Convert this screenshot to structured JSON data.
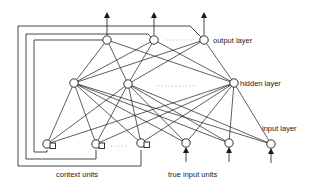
{
  "diagram": {
    "labels": {
      "output_layer": "output layer",
      "hidden_layer": "hidden layer",
      "input_layer": "input layer",
      "context_units": "context units",
      "true_input_units": "true input units"
    },
    "layers": {
      "output": [
        {
          "id": "o1",
          "x": 107,
          "y": 40
        },
        {
          "id": "o2",
          "x": 154,
          "y": 40
        },
        {
          "id": "o3",
          "x": 204,
          "y": 40
        }
      ],
      "hidden": [
        {
          "id": "h1",
          "x": 74,
          "y": 83
        },
        {
          "id": "h2",
          "x": 128,
          "y": 84
        },
        {
          "id": "h3",
          "x": 234,
          "y": 83
        }
      ],
      "context": [
        {
          "id": "c1",
          "x": 47,
          "y": 144
        },
        {
          "id": "c2",
          "x": 96,
          "y": 144
        },
        {
          "id": "c3",
          "x": 141,
          "y": 143
        }
      ],
      "true_input": [
        {
          "id": "i1",
          "x": 186,
          "y": 143
        },
        {
          "id": "i2",
          "x": 229,
          "y": 143
        },
        {
          "id": "i3",
          "x": 271,
          "y": 144
        }
      ]
    },
    "ellipses": [
      {
        "between": "o2-o3",
        "x1": 166,
        "x2": 192,
        "y": 40
      },
      {
        "between": "h2-h3",
        "x1": 158,
        "x2": 196,
        "y": 86
      },
      {
        "between": "c2-c3",
        "x1": 111,
        "x2": 126,
        "y": 146
      }
    ],
    "connections": "fully connected: input+context -> hidden -> output; output units copy back to context units via feedback loops"
  }
}
